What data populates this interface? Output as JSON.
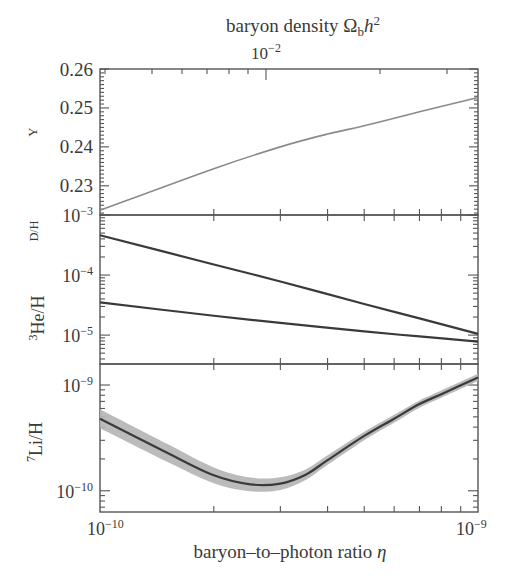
{
  "chart_data": [
    {
      "type": "line",
      "panel": "helium-4",
      "title": "baryon density Ωbh²",
      "top_axis": {
        "label": "baryon density Ωbh²",
        "scale": "log",
        "tick_labels": [
          "10−2"
        ]
      },
      "xlabel": "baryon–to–photon ratio η",
      "ylabel": "Y",
      "xscale": "log",
      "xlim": [
        1e-10,
        1e-09
      ],
      "ylim": [
        0.2225,
        0.26
      ],
      "yticks": [
        0.23,
        0.24,
        0.25,
        0.26
      ],
      "ytick_labels": [
        "0.23",
        "0.24",
        "0.25",
        "0.26"
      ],
      "series": [
        {
          "name": "Y",
          "color": "#8a8a8a",
          "x": [
            1e-10,
            2e-10,
            3e-10,
            4e-10,
            5e-10,
            7e-10,
            1e-09
          ],
          "values": [
            0.2237,
            0.2344,
            0.24,
            0.2433,
            0.2454,
            0.249,
            0.2527
          ]
        }
      ]
    },
    {
      "type": "line",
      "panel": "deuterium-helium-3",
      "ylabel": [
        "D/H",
        "³He/H"
      ],
      "xscale": "log",
      "yscale": "log",
      "xlim": [
        1e-10,
        1e-09
      ],
      "ylim": [
        3.3e-06,
        0.001
      ],
      "yticks": [
        0.001,
        0.0001,
        1e-05
      ],
      "ytick_labels": [
        "10−3",
        "10−4",
        "10−5"
      ],
      "series": [
        {
          "name": "D/H",
          "color": "#3a3a3a",
          "x": [
            1e-10,
            2e-10,
            3e-10,
            5e-10,
            7e-10,
            1e-09
          ],
          "values": [
            0.00046,
            0.00015,
            7.8e-05,
            3.3e-05,
            1.9e-05,
            1.05e-05
          ]
        },
        {
          "name": "³He/H",
          "color": "#3a3a3a",
          "x": [
            1e-10,
            2e-10,
            3e-10,
            5e-10,
            7e-10,
            1e-09
          ],
          "values": [
            3.5e-05,
            2.1e-05,
            1.6e-05,
            1.15e-05,
            9.5e-06,
            7.8e-06
          ]
        }
      ]
    },
    {
      "type": "area",
      "panel": "lithium-7",
      "ylabel": "⁷Li/H",
      "xlabel": "baryon–to–photon ratio η",
      "xscale": "log",
      "yscale": "log",
      "xlim": [
        1e-10,
        1e-09
      ],
      "ylim": [
        6.3e-11,
        1.58e-09
      ],
      "yticks": [
        1e-09,
        1e-10
      ],
      "ytick_labels": [
        "10−9",
        "10−10"
      ],
      "xtick_labels": [
        "10−10",
        "10−9"
      ],
      "series": [
        {
          "name": "⁷Li/H",
          "color": "#3a3a3a",
          "band_color": "#b4b4b4",
          "x": [
            1e-10,
            1.5e-10,
            2e-10,
            2.5e-10,
            3e-10,
            3.5e-10,
            4e-10,
            5e-10,
            6e-10,
            7e-10,
            8e-10,
            1e-09
          ],
          "values": [
            4.8e-10,
            2.3e-10,
            1.4e-10,
            1.15e-10,
            1.17e-10,
            1.42e-10,
            1.95e-10,
            3.3e-10,
            4.8e-10,
            6.6e-10,
            8.2e-10,
            1.18e-09
          ],
          "band_rel_halfwidth_dex": [
            0.09,
            0.085,
            0.075,
            0.065,
            0.06,
            0.05,
            0.045,
            0.04,
            0.038,
            0.035,
            0.035,
            0.035
          ]
        }
      ]
    }
  ],
  "labels": {
    "top_title": "baryon density Ωbh²",
    "top_title_main": "baryon density ",
    "top_title_omega": "Ω",
    "top_title_sub": "b",
    "top_title_h": "h",
    "top_title_sup": "2",
    "top_tick_base": "10",
    "top_tick_exp": "−2",
    "y_label_helium": "Y",
    "y_label_deuterium": "D/H",
    "y_label_he3_sup": "3",
    "y_label_he3": "He/H",
    "y_label_li_sup": "7",
    "y_label_li": "Li/H",
    "ytick_026": "0.26",
    "ytick_025": "0.25",
    "ytick_024": "0.24",
    "ytick_023": "0.23",
    "pow_base": "10",
    "exp_m3": "−3",
    "exp_m4": "−4",
    "exp_m5": "−5",
    "exp_m9": "−9",
    "exp_m10": "−10",
    "x_label_main": "baryon–to–photon ratio ",
    "x_label_eta": "η"
  }
}
